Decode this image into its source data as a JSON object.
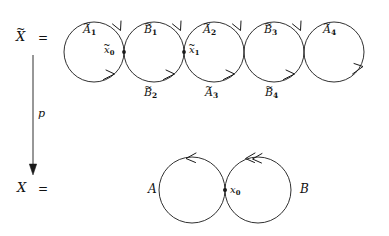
{
  "figure": {
    "type": "covering-space-diagram",
    "stroke_color": "#1a1a1a",
    "background_color": "#ffffff"
  },
  "left_column": {
    "total_space_label": "X",
    "total_space_tilde": "~",
    "total_space_equals": "=",
    "base_space_label": "X",
    "base_space_equals": "=",
    "map_label": "p"
  },
  "covering_space": {
    "circle_count": 5,
    "radius": 30,
    "center_y": 52,
    "centers_x": [
      94,
      154,
      214,
      274,
      334
    ],
    "top_labels": [
      {
        "letter": "A",
        "sub": "1",
        "tilde": "~",
        "cx": 94
      },
      {
        "letter": "B",
        "sub": "1",
        "tilde": "~",
        "cx": 154
      },
      {
        "letter": "A",
        "sub": "2",
        "tilde": "~",
        "cx": 214
      },
      {
        "letter": "B",
        "sub": "3",
        "tilde": "~",
        "cx": 274
      },
      {
        "letter": "A",
        "sub": "4",
        "tilde": "~",
        "cx": 334
      }
    ],
    "bottom_labels": [
      {
        "letter": "B",
        "sub": "2",
        "tilde": "~",
        "cx": 154
      },
      {
        "letter": "A",
        "sub": "3",
        "tilde": "~",
        "cx": 214
      },
      {
        "letter": "B",
        "sub": "4",
        "tilde": "~",
        "cx": 274
      }
    ],
    "basepoints": [
      {
        "letter": "x",
        "sub": "0",
        "tilde": "~",
        "x": 124,
        "y": 52,
        "side": "left"
      },
      {
        "letter": "x",
        "sub": "1",
        "tilde": "~",
        "x": 184,
        "y": 52,
        "side": "right"
      }
    ],
    "tangent_points_x": [
      124,
      184,
      244,
      304
    ],
    "arrow_direction_top": "counterclockwise-left",
    "arrow_direction_bottom": "clockwise-right"
  },
  "base_space": {
    "circle_count": 2,
    "radius": 33,
    "center_y": 190,
    "centers_x": [
      192,
      258
    ],
    "left_loop_label": "A",
    "right_loop_label": "B",
    "basepoint_label": "x",
    "basepoint_sub": "0",
    "basepoint_x": 225,
    "basepoint_y": 190,
    "left_arrowhead": "single-chevron",
    "right_arrowhead": "double-chevron"
  }
}
